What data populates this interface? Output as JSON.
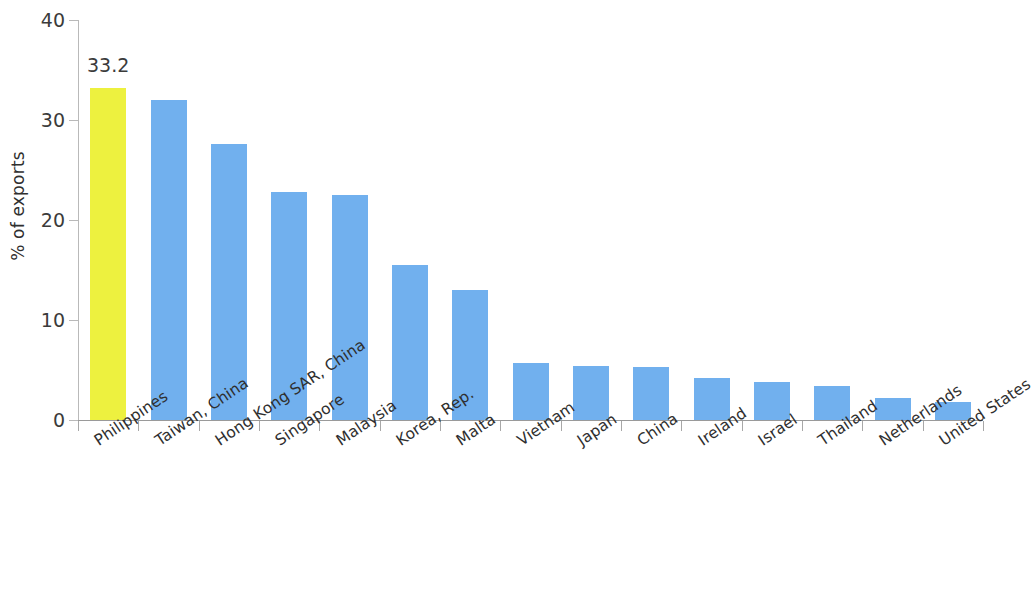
{
  "chart_data": {
    "type": "bar",
    "title": "",
    "subtitle": "",
    "xlabel": "",
    "ylabel": "% of exports",
    "ylim": [
      0,
      40
    ],
    "ytick_labels": [
      "40",
      "30",
      "20",
      "10",
      "0"
    ],
    "yticks": [
      40,
      30,
      20,
      10,
      0
    ],
    "grid": false,
    "legend": null,
    "categories": [
      "Philippines",
      "Taiwan, China",
      "Hong Kong SAR, China",
      "Singapore",
      "Malaysia",
      "Korea, Rep.",
      "Malta",
      "Vietnam",
      "Japan",
      "China",
      "Ireland",
      "Israel",
      "Thailand",
      "Netherlands",
      "United States"
    ],
    "values": [
      33.2,
      32.0,
      27.6,
      22.8,
      22.5,
      15.5,
      13.0,
      5.7,
      5.4,
      5.3,
      4.2,
      3.8,
      3.4,
      2.2,
      1.8
    ],
    "data_labels": [
      {
        "index": 0,
        "text": "33.2"
      }
    ],
    "highlight_index": 0,
    "colors": {
      "bar": "#71b0ee",
      "highlight_bar": "#edf13f",
      "axis": "#a8a8a8",
      "text": "#2f2f2f",
      "background": "#ffffff"
    }
  }
}
